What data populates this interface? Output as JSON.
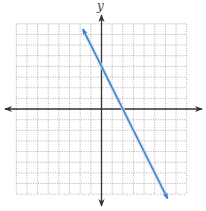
{
  "chart_data": {
    "type": "line",
    "title": "",
    "xlabel": "",
    "ylabel": "y",
    "xlim": [
      -8,
      8
    ],
    "ylim": [
      -8,
      8
    ],
    "grid": true,
    "grid_style": "dotted",
    "grid_step": 1,
    "tick_labels": false,
    "series": [
      {
        "name": "line",
        "equation": "y = -2x + 4",
        "slope": -2,
        "intercept": 4,
        "x": [
          -1.75,
          6.2
        ],
        "y": [
          7.5,
          -8.4
        ],
        "arrows_both_ends": true,
        "color": "#3a7bc8"
      }
    ],
    "key_points": {
      "y_intercept": [
        0,
        4
      ],
      "x_intercept": [
        2,
        0
      ]
    }
  },
  "colors": {
    "grid": "#9a9a9a",
    "axis": "#333333",
    "line": "#3a7bc8",
    "line_glow": "#bcd6f2"
  },
  "layout": {
    "origin_px": [
      101.5,
      109
    ],
    "unit_px": 10.65,
    "x_axis_px": [
      5,
      202
    ],
    "y_axis_px": [
      15,
      206
    ]
  }
}
